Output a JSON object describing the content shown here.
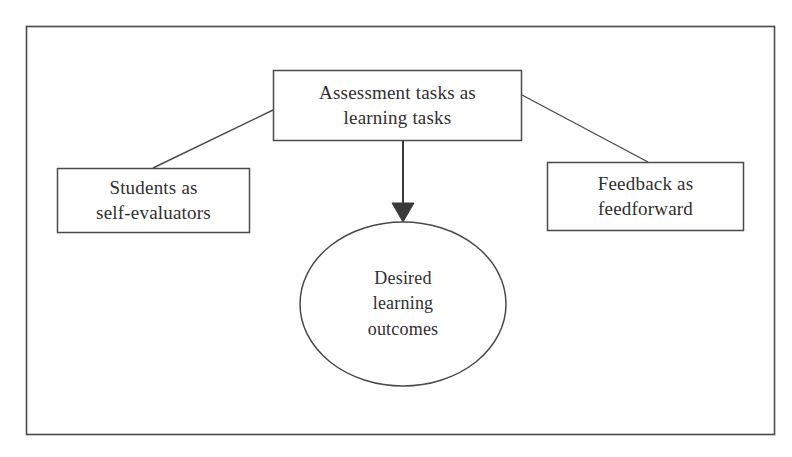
{
  "diagram": {
    "frame": {
      "name": "outer-frame",
      "x": 26,
      "y": 26,
      "width": 749,
      "height": 409,
      "stroke": "#4a4a4a"
    },
    "style": {
      "background": "#ffffff",
      "line_color": "#4a4a4a",
      "text_color": "#2f2f2f",
      "arrow_color": "#3a3a3a"
    },
    "nodes": [
      {
        "id": "assessment-tasks",
        "shape": "rectangle",
        "lines": [
          "Assessment tasks as",
          "learning tasks"
        ],
        "x": 273,
        "y": 70,
        "width": 249,
        "height": 71
      },
      {
        "id": "students-self-evaluators",
        "shape": "rectangle",
        "lines": [
          "Students as",
          "self-evaluators"
        ],
        "x": 57,
        "y": 168,
        "width": 193,
        "height": 65
      },
      {
        "id": "feedback-feedforward",
        "shape": "rectangle",
        "lines": [
          "Feedback as",
          "feedforward"
        ],
        "x": 547,
        "y": 162,
        "width": 197,
        "height": 69
      },
      {
        "id": "desired-learning-outcomes",
        "shape": "ellipse",
        "lines": [
          "Desired",
          "learning",
          "outcomes"
        ],
        "cx": 403,
        "cy": 304,
        "rx": 103,
        "ry": 82
      }
    ],
    "connectors": [
      {
        "id": "top-to-left",
        "from": "assessment-tasks",
        "to": "students-self-evaluators",
        "arrowhead": "none",
        "x1": 273,
        "y1": 110,
        "x2": 153,
        "y2": 168
      },
      {
        "id": "top-to-right",
        "from": "assessment-tasks",
        "to": "feedback-feedforward",
        "arrowhead": "none",
        "x1": 522,
        "y1": 95,
        "x2": 648,
        "y2": 162
      },
      {
        "id": "top-to-outcomes",
        "from": "assessment-tasks",
        "to": "desired-learning-outcomes",
        "arrowhead": "filled-triangle",
        "x1": 403,
        "y1": 141,
        "x2": 403,
        "y2": 222
      }
    ]
  }
}
